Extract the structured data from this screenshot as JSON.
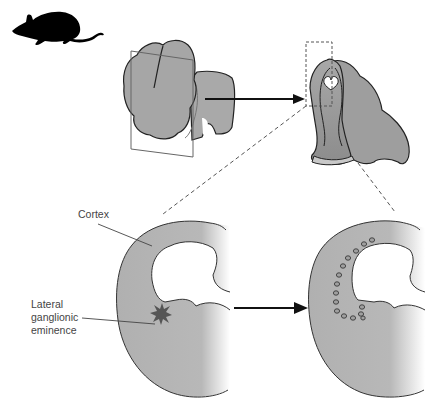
{
  "figure": {
    "type": "anatomical-diagram",
    "panels": [
      {
        "id": "mouse",
        "icon": "mouse-silhouette-icon"
      },
      {
        "id": "whole-brain",
        "description": "whole embryonic brain with coronal section plane"
      },
      {
        "id": "coronal-section",
        "description": "coronal slice of forebrain with dashed inset box"
      },
      {
        "id": "hemisphere-before",
        "description": "hemisphere with graft site marker in lateral ganglionic eminence"
      },
      {
        "id": "hemisphere-after",
        "description": "hemisphere showing migrated cells along cortex"
      }
    ],
    "labels": {
      "cortex": "Cortex",
      "lge_line1": "Lateral",
      "lge_line2": "ganglionic",
      "lge_line3": "eminence"
    },
    "markers": {
      "graft_site": "star-marker",
      "migrated_cells_count": 15
    },
    "colors": {
      "tissue_fill": "#b4b4b4",
      "tissue_dark": "#8f8f8f",
      "outline": "#222222",
      "star": "#555555",
      "arrow": "#111111",
      "dashed": "#555555"
    }
  }
}
